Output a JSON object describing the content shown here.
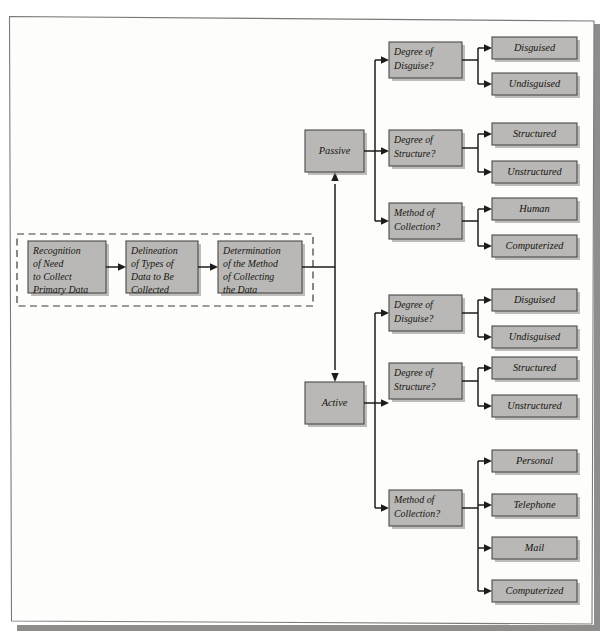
{
  "figure": {
    "colors": {
      "box_fill": "#b9b8b6",
      "box_stroke": "#4a4947",
      "line": "#1d1c1b",
      "page": "#fdfdfc",
      "page_border": "#7b7a78",
      "shadow": "#8e8d8b"
    }
  },
  "process": {
    "group_label": "",
    "steps": [
      {
        "id": "recognition",
        "lines": [
          "Recognition",
          "of Need",
          "to Collect",
          "Primary Data"
        ]
      },
      {
        "id": "delineation",
        "lines": [
          "Delineation",
          "of Types of",
          "Data to Be",
          "Collected"
        ]
      },
      {
        "id": "determination",
        "lines": [
          "Determination",
          "of the Method",
          "of Collecting",
          "the Data"
        ]
      }
    ]
  },
  "approaches": [
    {
      "id": "passive",
      "label": "Passive"
    },
    {
      "id": "active",
      "label": "Active"
    }
  ],
  "branches": [
    {
      "approach": "passive",
      "questions": [
        {
          "id": "passive-disguise",
          "lines": [
            "Degree of",
            "Disguise?"
          ],
          "outcomes": [
            {
              "id": "passive-disguised",
              "label": "Disguised"
            },
            {
              "id": "passive-undisguised",
              "label": "Undisguised"
            }
          ]
        },
        {
          "id": "passive-structure",
          "lines": [
            "Degree of",
            "Structure?"
          ],
          "outcomes": [
            {
              "id": "passive-structured",
              "label": "Structured"
            },
            {
              "id": "passive-unstructured",
              "label": "Unstructured"
            }
          ]
        },
        {
          "id": "passive-method",
          "lines": [
            "Method of",
            "Collection?"
          ],
          "outcomes": [
            {
              "id": "passive-human",
              "label": "Human"
            },
            {
              "id": "passive-computerized",
              "label": "Computerized"
            }
          ]
        }
      ]
    },
    {
      "approach": "active",
      "questions": [
        {
          "id": "active-disguise",
          "lines": [
            "Degree of",
            "Disguise?"
          ],
          "outcomes": [
            {
              "id": "active-disguised",
              "label": "Disguised"
            },
            {
              "id": "active-undisguised",
              "label": "Undisguised"
            }
          ]
        },
        {
          "id": "active-structure",
          "lines": [
            "Degree of",
            "Structure?"
          ],
          "outcomes": [
            {
              "id": "active-structured",
              "label": "Structured"
            },
            {
              "id": "active-unstructured",
              "label": "Unstructured"
            }
          ]
        },
        {
          "id": "active-method",
          "lines": [
            "Method of",
            "Collection?"
          ],
          "outcomes": [
            {
              "id": "active-personal",
              "label": "Personal"
            },
            {
              "id": "active-telephone",
              "label": "Telephone"
            },
            {
              "id": "active-mail",
              "label": "Mail"
            },
            {
              "id": "active-computerized",
              "label": "Computerized"
            }
          ]
        }
      ]
    }
  ]
}
